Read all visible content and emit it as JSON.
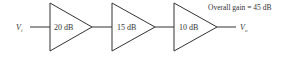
{
  "diagram": {
    "title": "Overall gain = 45 dB",
    "input_label": "V",
    "input_sub": "i",
    "output_label": "V",
    "output_sub": "o",
    "stages": [
      {
        "gain": "20 dB"
      },
      {
        "gain": "15 dB"
      },
      {
        "gain": "10 dB"
      }
    ],
    "colors": {
      "stroke": "#333333",
      "text": "#333333"
    }
  }
}
